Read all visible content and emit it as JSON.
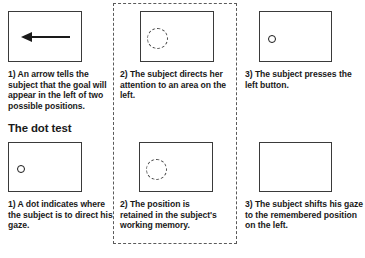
{
  "figure": {
    "background_color": "#ffffff",
    "line_color": "#3a3a3a",
    "dashed_color": "#5a5a5a",
    "text_color": "#1a1a1a"
  },
  "highlight_panel": {
    "style": "dashed",
    "label": "middle-column-highlight"
  },
  "row_top": {
    "panels": [
      {
        "id": "top-1",
        "stimulus": "left-pointing-arrow",
        "caption": "1) An arrow tells the subject that the goal will appear in the left of two possible positions."
      },
      {
        "id": "top-2",
        "stimulus": "dashed-attention-circle-left",
        "caption": "2) The subject directs her attention to an area on the left."
      },
      {
        "id": "top-3",
        "stimulus": "small-hollow-dot-left",
        "caption": "3) The subject presses the left button."
      }
    ]
  },
  "section": {
    "heading": "The dot test"
  },
  "row_bottom": {
    "panels": [
      {
        "id": "bottom-1",
        "stimulus": "small-hollow-dot-left",
        "caption": "1) A dot indicates where the subject is to direct his gaze."
      },
      {
        "id": "bottom-2",
        "stimulus": "dashed-attention-circle-left",
        "caption": "2) The position is retained in the subject's working memory."
      },
      {
        "id": "bottom-3",
        "stimulus": "empty-display",
        "caption": "3) The subject shifts his gaze to the remembered position on the left."
      }
    ]
  },
  "footnote": {
    "text": ""
  }
}
